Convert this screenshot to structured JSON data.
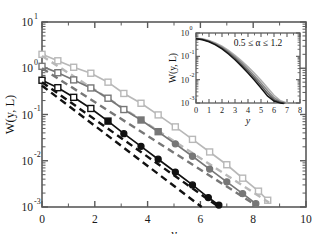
{
  "figure": {
    "background": "#ffffff",
    "width": 315,
    "height": 234
  },
  "main_axes": {
    "xlabel": "y",
    "ylabel": "W(y, L)",
    "xticks": [
      "0",
      "2",
      "4",
      "6",
      "8",
      "10"
    ],
    "ytick_labels": [
      "10",
      "10",
      "10",
      "10",
      "10"
    ],
    "ytick_exponents": [
      "1",
      "0",
      "-1",
      "-2",
      "-3"
    ]
  },
  "inset_axes": {
    "xlabel": "y",
    "ylabel": "W(y, L)",
    "annotation": "0.5 ≤ α ≤ 1.2",
    "xticks": [
      "0",
      "1",
      "2",
      "3",
      "4",
      "5",
      "6",
      "7",
      "8"
    ],
    "ytick_labels": [
      "10",
      "10",
      "10",
      "10"
    ],
    "ytick_exponents": [
      "0",
      "-1",
      "-2",
      "-3"
    ]
  },
  "colors": {
    "light_gray": "#b8b8b8",
    "mid_gray": "#777777",
    "black": "#111111",
    "axis": "#555555",
    "frame": "#5a5a5a"
  },
  "chart_data": {
    "type": "line",
    "title": "",
    "xlabel": "y",
    "ylabel": "W(y, L)",
    "xlim": [
      0,
      10
    ],
    "ylim": [
      0.001,
      10
    ],
    "xscale": "linear",
    "yscale": "log",
    "grid": false,
    "legend": "none",
    "series": [
      {
        "name": "light-gray-open-squares",
        "color": "#b8b8b8",
        "marker": "open-square",
        "marker_size": 6,
        "linestyle": "solid",
        "x": [
          0.0,
          0.6,
          1.2,
          1.85,
          2.5,
          3.1,
          3.75,
          4.4,
          5.05,
          5.7,
          6.35,
          7.0,
          7.6,
          8.2,
          8.55
        ],
        "y": [
          2.0,
          1.45,
          1.05,
          0.78,
          0.5,
          0.285,
          0.175,
          0.098,
          0.054,
          0.029,
          0.0155,
          0.0082,
          0.0042,
          0.0022,
          0.0014
        ]
      },
      {
        "name": "light-gray-dashed-reference",
        "color": "#b8b8b8",
        "marker": "none",
        "linestyle": "dashed",
        "x": [
          0.0,
          8.6
        ],
        "y": [
          1.85,
          0.00125
        ]
      },
      {
        "name": "mid-gray-open-squares-circles",
        "color": "#777777",
        "marker": "open-square-then-filled-circle",
        "marker_size": 6,
        "linestyle": "solid",
        "x": [
          0.0,
          0.6,
          1.2,
          1.85,
          2.5,
          3.1,
          3.75,
          4.4,
          5.05,
          5.7,
          6.35,
          7.0,
          7.6,
          8.1
        ],
        "y": [
          1.1,
          0.8,
          0.56,
          0.375,
          0.225,
          0.128,
          0.076,
          0.0425,
          0.0232,
          0.0125,
          0.0066,
          0.0035,
          0.00195,
          0.00118
        ]
      },
      {
        "name": "mid-gray-dashed-reference",
        "color": "#777777",
        "marker": "none",
        "linestyle": "dashed",
        "x": [
          0.0,
          8.15
        ],
        "y": [
          1.0,
          0.00105
        ]
      },
      {
        "name": "black-open-squares-filled-circles",
        "color": "#111111",
        "marker": "open-square-then-filled-circle",
        "marker_size": 6,
        "linestyle": "solid",
        "x": [
          0.0,
          0.6,
          1.2,
          1.85,
          2.5,
          3.1,
          3.75,
          4.4,
          5.05,
          5.7,
          6.3,
          6.7
        ],
        "y": [
          0.55,
          0.38,
          0.235,
          0.135,
          0.072,
          0.0385,
          0.0205,
          0.0108,
          0.0057,
          0.003,
          0.0016,
          0.0011
        ]
      },
      {
        "name": "black-dashed-reference",
        "color": "#111111",
        "marker": "none",
        "linestyle": "dashed",
        "x": [
          0.0,
          6.7
        ],
        "y": [
          0.5,
          0.001
        ]
      },
      {
        "name": "black-dashed-steep",
        "color": "#111111",
        "marker": "none",
        "linestyle": "dashed",
        "x": [
          0.0,
          6.05
        ],
        "y": [
          0.42,
          0.001
        ]
      }
    ],
    "inset": {
      "type": "line",
      "xlabel": "y",
      "ylabel": "W(y, L)",
      "annotation": "0.5 ≤ α ≤ 1.2",
      "xlim": [
        0,
        8
      ],
      "ylim": [
        0.001,
        1
      ],
      "yscale": "log",
      "series": [
        {
          "name": "alpha-1.2",
          "color": "#b0b0b0",
          "x": [
            0.0,
            0.5,
            1.0,
            1.5,
            2.0,
            2.5,
            3.0,
            3.5,
            4.0,
            4.5,
            5.0,
            5.5,
            6.0,
            6.5,
            7.05
          ],
          "y": [
            0.6,
            0.565,
            0.48,
            0.375,
            0.27,
            0.178,
            0.11,
            0.064,
            0.0355,
            0.0187,
            0.0094,
            0.00455,
            0.00215,
            0.00125,
            0.00098
          ]
        },
        {
          "name": "alpha-1.0",
          "color": "#8a8a8a",
          "x": [
            0.0,
            0.5,
            1.0,
            1.5,
            2.0,
            2.5,
            3.0,
            3.5,
            4.0,
            4.5,
            5.0,
            5.5,
            6.0,
            6.5,
            6.95
          ],
          "y": [
            0.585,
            0.545,
            0.455,
            0.348,
            0.247,
            0.158,
            0.095,
            0.0535,
            0.0288,
            0.0148,
            0.00725,
            0.0034,
            0.00168,
            0.00112,
            0.00098
          ]
        },
        {
          "name": "alpha-0.8",
          "color": "#5a5a5a",
          "x": [
            0.0,
            0.5,
            1.0,
            1.5,
            2.0,
            2.5,
            3.0,
            3.5,
            4.0,
            4.5,
            5.0,
            5.5,
            6.0,
            6.5,
            6.85
          ],
          "y": [
            0.575,
            0.53,
            0.437,
            0.327,
            0.226,
            0.141,
            0.0825,
            0.045,
            0.0236,
            0.0118,
            0.00565,
            0.00262,
            0.0014,
            0.00105,
            0.00097
          ]
        },
        {
          "name": "alpha-0.5",
          "color": "#141414",
          "x": [
            0.0,
            0.5,
            1.0,
            1.5,
            2.0,
            2.5,
            3.0,
            3.5,
            4.0,
            4.5,
            5.0,
            5.5,
            6.0,
            6.5,
            6.75
          ],
          "y": [
            0.565,
            0.518,
            0.42,
            0.308,
            0.207,
            0.126,
            0.0715,
            0.038,
            0.0193,
            0.0094,
            0.0044,
            0.00202,
            0.00122,
            0.00099,
            0.00096
          ]
        }
      ]
    }
  }
}
